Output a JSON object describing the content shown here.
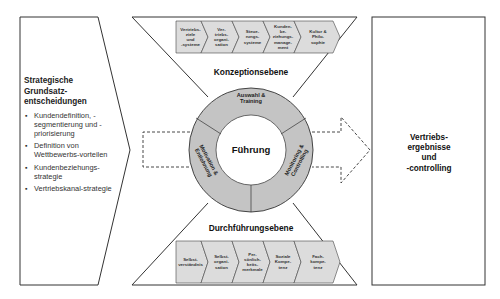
{
  "left_panel": {
    "title": "Strategische Grundsatz-entscheidungen",
    "title_lines": [
      "Strategische",
      "Grundsatz-",
      "entscheidungen"
    ],
    "items": [
      {
        "label": "Kundendefinition, -segmentierung und -priorisierung"
      },
      {
        "label": "Definition von Wettbewerbs-vorteilen"
      },
      {
        "label": "Kundenbeziehungs-strategie"
      },
      {
        "label": "Vertriebskanal-strategie"
      }
    ]
  },
  "top_level": {
    "title": "Konzeptionsebene",
    "chevrons": [
      {
        "label": "Vertriebs-\nziele\nund\n-systeme"
      },
      {
        "label": "Ver-\ntriebs-\norgani-\nsation"
      },
      {
        "label": "Steue-\nrungs-\nsysteme"
      },
      {
        "label": "Kunden-\nbe-\nziehungs-\nmanage-\nment"
      },
      {
        "label": "Kultur &\nPhilo-\nsophie"
      }
    ]
  },
  "center": {
    "label": "Führung",
    "segments": [
      {
        "label": "Auswahl &\nTraining"
      },
      {
        "label": "Monitoring &\nControlling"
      },
      {
        "label": "Motivation &\nEntlohnung"
      }
    ]
  },
  "bottom_level": {
    "title": "Durchführungsebene",
    "chevrons": [
      {
        "label": "Selbst-\nverständnis"
      },
      {
        "label": "Selbst-\norgani-\nsation"
      },
      {
        "label": "Per-\nsönlich-\nkeits-\nmerkmale"
      },
      {
        "label": "Soziale\nKompe-\ntenz"
      },
      {
        "label": "Fach-\nkompe-\ntenz"
      }
    ]
  },
  "right_panel": {
    "label": "Vertriebs-\nergebnisse\nund\n-controlling"
  },
  "colors": {
    "stroke": "#333333",
    "ring_fill": "#c4c4c4",
    "chevron_fill": "#dcdcdc",
    "background": "#ffffff"
  }
}
